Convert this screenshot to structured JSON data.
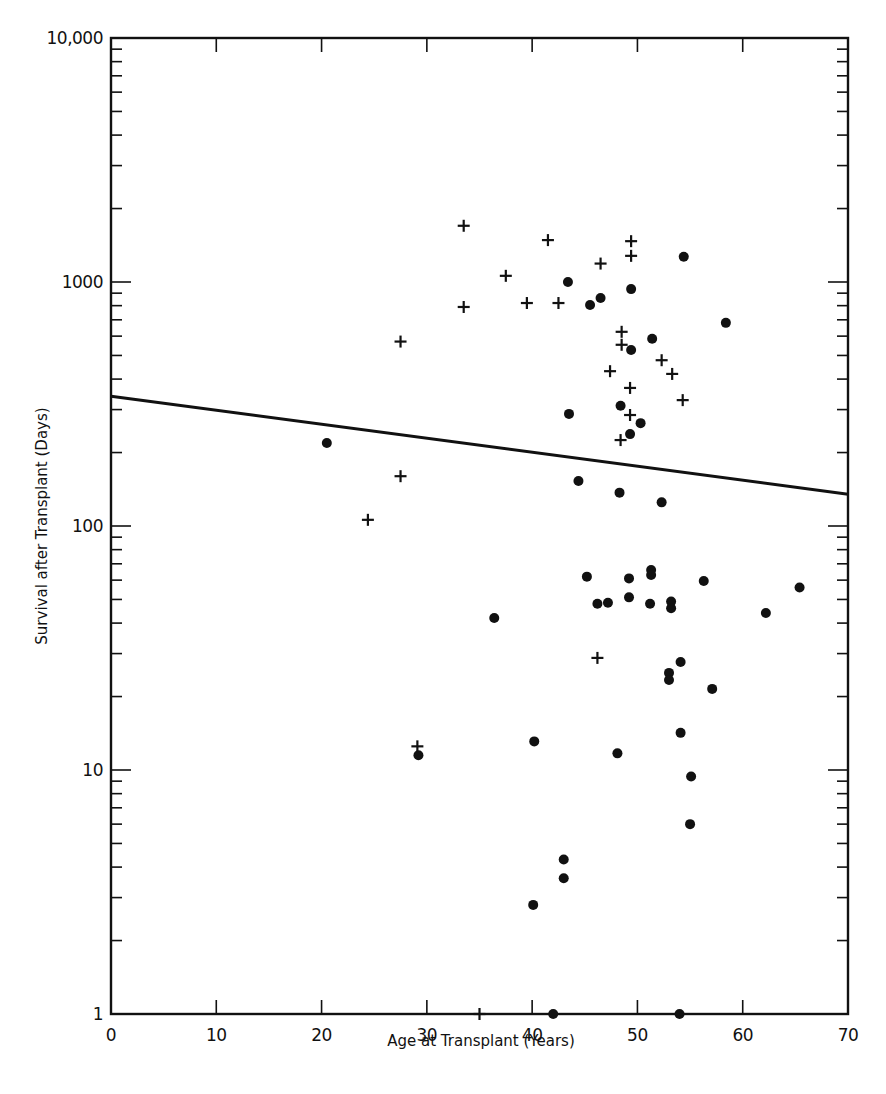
{
  "chart_data": {
    "type": "scatter",
    "title": "",
    "xlabel": "Age at Transplant (Years)",
    "ylabel": "Survival after Transplant (Days)",
    "xlim": [
      0,
      70
    ],
    "ylim": [
      1,
      10000
    ],
    "yscale": "log",
    "grid": false,
    "legend": null,
    "x_ticks": [
      0,
      10,
      20,
      30,
      40,
      50,
      60,
      70
    ],
    "x_tick_labels": [
      "0",
      "10",
      "20",
      "30",
      "40",
      "50",
      "60",
      "70"
    ],
    "y_ticks": [
      1,
      10,
      100,
      1000,
      10000
    ],
    "y_tick_labels": [
      "1",
      "10",
      "100",
      "1000",
      "10,000"
    ],
    "series": [
      {
        "name": "dead",
        "marker": "dot",
        "points": [
          [
            43.4,
            1000
          ],
          [
            54.4,
            1270
          ],
          [
            49.4,
            935
          ],
          [
            46.5,
            860
          ],
          [
            45.5,
            805
          ],
          [
            58.4,
            680
          ],
          [
            51.4,
            585
          ],
          [
            49.4,
            526
          ],
          [
            43.5,
            288
          ],
          [
            48.4,
            311
          ],
          [
            50.3,
            264
          ],
          [
            49.3,
            238
          ],
          [
            20.5,
            219
          ],
          [
            44.4,
            153
          ],
          [
            48.3,
            137
          ],
          [
            52.3,
            125
          ],
          [
            36.4,
            42
          ],
          [
            45.2,
            62
          ],
          [
            46.2,
            48
          ],
          [
            47.2,
            48.5
          ],
          [
            49.2,
            61
          ],
          [
            49.2,
            51
          ],
          [
            51.3,
            66
          ],
          [
            51.3,
            63
          ],
          [
            51.2,
            48
          ],
          [
            53.2,
            49
          ],
          [
            53.2,
            46
          ],
          [
            56.3,
            59.5
          ],
          [
            62.2,
            44
          ],
          [
            65.4,
            56
          ],
          [
            54.1,
            27.7
          ],
          [
            53.0,
            25
          ],
          [
            53.0,
            23.4
          ],
          [
            57.1,
            21.5
          ],
          [
            54.1,
            14.2
          ],
          [
            29.2,
            11.5
          ],
          [
            40.2,
            13.1
          ],
          [
            48.1,
            11.7
          ],
          [
            55.1,
            9.4
          ],
          [
            55.0,
            6.0
          ],
          [
            43.0,
            4.3
          ],
          [
            43.0,
            3.6
          ],
          [
            40.1,
            2.8
          ],
          [
            42.0,
            1
          ],
          [
            54.0,
            1
          ]
        ]
      },
      {
        "name": "alive",
        "marker": "plus",
        "points": [
          [
            33.5,
            1700
          ],
          [
            41.5,
            1485
          ],
          [
            49.4,
            1470
          ],
          [
            49.4,
            1280
          ],
          [
            46.5,
            1190
          ],
          [
            37.5,
            1060
          ],
          [
            33.5,
            790
          ],
          [
            39.5,
            820
          ],
          [
            42.5,
            820
          ],
          [
            27.5,
            570
          ],
          [
            48.5,
            625
          ],
          [
            48.5,
            553
          ],
          [
            52.3,
            478
          ],
          [
            47.4,
            431
          ],
          [
            53.3,
            420
          ],
          [
            49.3,
            368
          ],
          [
            54.3,
            328
          ],
          [
            49.3,
            285
          ],
          [
            48.4,
            225
          ],
          [
            27.5,
            160
          ],
          [
            24.4,
            106
          ],
          [
            46.2,
            28.8
          ],
          [
            29.1,
            12.5
          ],
          [
            35.0,
            1
          ]
        ]
      }
    ],
    "regression_line": {
      "x": [
        0,
        70
      ],
      "y": [
        340,
        135
      ]
    }
  },
  "plot_area": {
    "left": 111,
    "right": 848,
    "top": 38,
    "bottom": 1014
  },
  "colors": {
    "ink": "#111111",
    "background": "#ffffff"
  }
}
